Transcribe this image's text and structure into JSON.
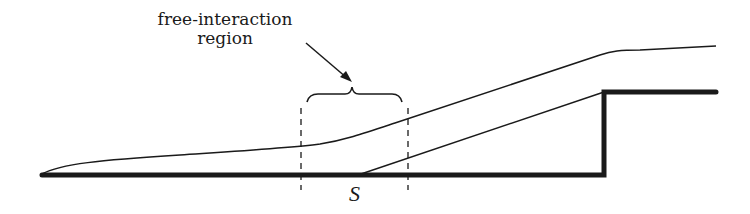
{
  "diagram": {
    "title_line1": "free-interaction",
    "title_line2": "region",
    "point_label": "S",
    "colors": {
      "stroke": "#1a1a1a",
      "background": "#ffffff"
    }
  }
}
